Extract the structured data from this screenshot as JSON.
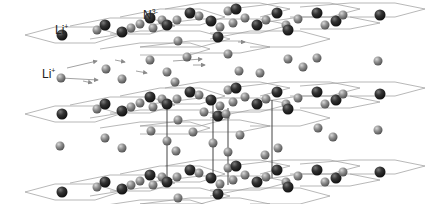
{
  "diagram": {
    "labels": {
      "li_top": {
        "base": "Li",
        "sup": "+"
      },
      "n_top": {
        "base": "N",
        "sup": "3-"
      },
      "li_mid": {
        "base": "Li",
        "sup": "+"
      }
    },
    "species": [
      {
        "name": "N3- anion",
        "color": "#2b2b2b"
      },
      {
        "name": "Li+ cation",
        "color": "#8a8a8a"
      }
    ],
    "layers": 3,
    "migration_arrows": 6,
    "colors": {
      "dark_atom": "#2e2e2e",
      "light_atom": "#8c8c8c",
      "mesh_line": "#9a9a9a",
      "cell_line": "#444444",
      "arrow": "#8a8a8a"
    }
  }
}
